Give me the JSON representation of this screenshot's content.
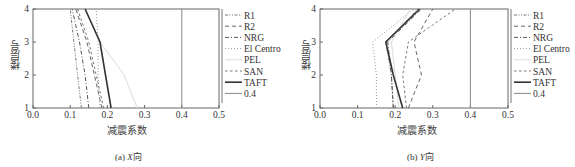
{
  "chart_data": [
    {
      "type": "line",
      "panel": "a",
      "caption_prefix": "(a) ",
      "caption_axis": "X",
      "caption_suffix": "向",
      "title": "(a) X向",
      "xlabel": "减震系数",
      "ylabel": "楼层号",
      "xlim": [
        0.0,
        0.5
      ],
      "ylim": [
        1,
        4
      ],
      "xticks": [
        "0.0",
        "0.1",
        "0.2",
        "0.3",
        "0.4",
        "0.5"
      ],
      "yticks": [
        "1",
        "2",
        "3",
        "4"
      ],
      "grid": false,
      "legend_position": "right",
      "y": [
        1,
        2,
        3,
        4
      ],
      "series": [
        {
          "name": "R1",
          "values": [
            0.13,
            0.12,
            0.11,
            0.1
          ],
          "style": "dashdotdot",
          "color": "#7a7a7a"
        },
        {
          "name": "R2",
          "values": [
            0.185,
            0.165,
            0.145,
            0.115
          ],
          "style": "dash",
          "color": "#666666"
        },
        {
          "name": "NRG",
          "values": [
            0.15,
            0.14,
            0.125,
            0.105
          ],
          "style": "dashdot",
          "color": "#555555"
        },
        {
          "name": "El Centro",
          "values": [
            0.18,
            0.175,
            0.175,
            0.17
          ],
          "style": "dot",
          "color": "#9a9a9a"
        },
        {
          "name": "PEL",
          "values": [
            0.28,
            0.245,
            0.18,
            0.14
          ],
          "style": "solid-faint",
          "color": "#dddddd"
        },
        {
          "name": "SAN",
          "values": [
            0.19,
            0.17,
            0.15,
            0.12
          ],
          "style": "dashshort",
          "color": "#777777"
        },
        {
          "name": "TAFT",
          "values": [
            0.21,
            0.195,
            0.18,
            0.14
          ],
          "style": "solid",
          "color": "#333333"
        },
        {
          "name": "0.4",
          "values": [
            0.4,
            0.4,
            0.4,
            0.4
          ],
          "style": "solid-thin",
          "color": "#888888"
        }
      ]
    },
    {
      "type": "line",
      "panel": "b",
      "caption_prefix": "(b) ",
      "caption_axis": "Y",
      "caption_suffix": "向",
      "title": "(b) Y向",
      "xlabel": "减震系数",
      "ylabel": "楼层号",
      "xlim": [
        0.0,
        0.5
      ],
      "ylim": [
        1,
        4
      ],
      "xticks": [
        "0.0",
        "0.1",
        "0.2",
        "0.3",
        "0.4",
        "0.5"
      ],
      "yticks": [
        "1",
        "2",
        "3",
        "4"
      ],
      "grid": false,
      "legend_position": "right",
      "y": [
        1,
        2,
        3,
        4
      ],
      "series": [
        {
          "name": "R1",
          "values": [
            0.195,
            0.19,
            0.175,
            0.26
          ],
          "style": "dashdotdot",
          "color": "#7a7a7a"
        },
        {
          "name": "R2",
          "values": [
            0.235,
            0.27,
            0.25,
            0.3
          ],
          "style": "dash",
          "color": "#666666"
        },
        {
          "name": "NRG",
          "values": [
            0.195,
            0.19,
            0.18,
            0.27
          ],
          "style": "dashdot",
          "color": "#555555"
        },
        {
          "name": "El Centro",
          "values": [
            0.15,
            0.15,
            0.14,
            0.25
          ],
          "style": "dot",
          "color": "#9a9a9a"
        },
        {
          "name": "PEL",
          "values": [
            0.21,
            0.2,
            0.19,
            0.24
          ],
          "style": "solid-faint",
          "color": "#dddddd"
        },
        {
          "name": "SAN",
          "values": [
            0.23,
            0.22,
            0.235,
            0.36
          ],
          "style": "dashshort",
          "color": "#777777"
        },
        {
          "name": "TAFT",
          "values": [
            0.22,
            0.195,
            0.175,
            0.265
          ],
          "style": "solid",
          "color": "#333333"
        },
        {
          "name": "0.4",
          "values": [
            0.4,
            0.4,
            0.4,
            0.4
          ],
          "style": "solid-thin",
          "color": "#888888"
        }
      ]
    }
  ]
}
